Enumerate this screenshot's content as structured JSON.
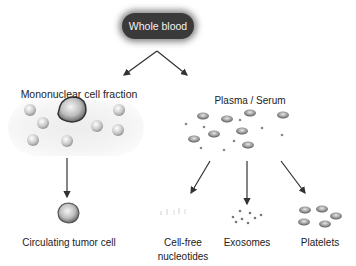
{
  "diagram": {
    "root": {
      "label": "Whole blood"
    },
    "branches": [
      {
        "id": "mononuclear",
        "label": "Mononuclear cell fraction"
      },
      {
        "id": "plasma",
        "label": "Plasma / Serum"
      }
    ],
    "leaves": [
      {
        "id": "ctc",
        "label": "Circulating tumor cell",
        "parent": "mononuclear"
      },
      {
        "id": "cfn",
        "label_line1": "Cell-free",
        "label_line2": "nucleotides",
        "parent": "plasma"
      },
      {
        "id": "exosomes",
        "label": "Exosomes",
        "parent": "plasma"
      },
      {
        "id": "platelets",
        "label": "Platelets",
        "parent": "plasma"
      }
    ],
    "colors": {
      "root_fill": "#3a3a3a",
      "root_text": "#f2f2f2",
      "arrow": "#333333",
      "text": "#222222"
    }
  }
}
